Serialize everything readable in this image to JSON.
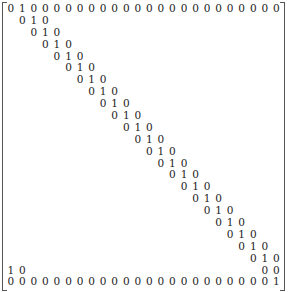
{
  "matrix": {
    "rows": 24,
    "cols": 24,
    "entries": [
      [
        "0",
        "1",
        "0",
        "0",
        "0",
        "0",
        "0",
        "0",
        "0",
        "0",
        "0",
        "0",
        "0",
        "0",
        "0",
        "0",
        "0",
        "0",
        "0",
        "0",
        "0",
        "0",
        "0",
        "0"
      ],
      [
        "",
        "0",
        "1",
        "0",
        "",
        "",
        "",
        "",
        "",
        "",
        "",
        "",
        "",
        "",
        "",
        "",
        "",
        "",
        "",
        "",
        "",
        "",
        "",
        ""
      ],
      [
        "",
        "",
        "0",
        "1",
        "0",
        "",
        "",
        "",
        "",
        "",
        "",
        "",
        "",
        "",
        "",
        "",
        "",
        "",
        "",
        "",
        "",
        "",
        "",
        ""
      ],
      [
        "",
        "",
        "",
        "0",
        "1",
        "0",
        "",
        "",
        "",
        "",
        "",
        "",
        "",
        "",
        "",
        "",
        "",
        "",
        "",
        "",
        "",
        "",
        "",
        ""
      ],
      [
        "",
        "",
        "",
        "",
        "0",
        "1",
        "0",
        "",
        "",
        "",
        "",
        "",
        "",
        "",
        "",
        "",
        "",
        "",
        "",
        "",
        "",
        "",
        "",
        ""
      ],
      [
        "",
        "",
        "",
        "",
        "",
        "0",
        "1",
        "0",
        "",
        "",
        "",
        "",
        "",
        "",
        "",
        "",
        "",
        "",
        "",
        "",
        "",
        "",
        "",
        ""
      ],
      [
        "",
        "",
        "",
        "",
        "",
        "",
        "0",
        "1",
        "0",
        "",
        "",
        "",
        "",
        "",
        "",
        "",
        "",
        "",
        "",
        "",
        "",
        "",
        "",
        ""
      ],
      [
        "",
        "",
        "",
        "",
        "",
        "",
        "",
        "0",
        "1",
        "0",
        "",
        "",
        "",
        "",
        "",
        "",
        "",
        "",
        "",
        "",
        "",
        "",
        "",
        ""
      ],
      [
        "",
        "",
        "",
        "",
        "",
        "",
        "",
        "",
        "0",
        "1",
        "0",
        "",
        "",
        "",
        "",
        "",
        "",
        "",
        "",
        "",
        "",
        "",
        "",
        ""
      ],
      [
        "",
        "",
        "",
        "",
        "",
        "",
        "",
        "",
        "",
        "0",
        "1",
        "0",
        "",
        "",
        "",
        "",
        "",
        "",
        "",
        "",
        "",
        "",
        "",
        ""
      ],
      [
        "",
        "",
        "",
        "",
        "",
        "",
        "",
        "",
        "",
        "",
        "0",
        "1",
        "0",
        "",
        "",
        "",
        "",
        "",
        "",
        "",
        "",
        "",
        "",
        ""
      ],
      [
        "",
        "",
        "",
        "",
        "",
        "",
        "",
        "",
        "",
        "",
        "",
        "0",
        "1",
        "0",
        "",
        "",
        "",
        "",
        "",
        "",
        "",
        "",
        "",
        ""
      ],
      [
        "",
        "",
        "",
        "",
        "",
        "",
        "",
        "",
        "",
        "",
        "",
        "",
        "0",
        "1",
        "0",
        "",
        "",
        "",
        "",
        "",
        "",
        "",
        "",
        ""
      ],
      [
        "",
        "",
        "",
        "",
        "",
        "",
        "",
        "",
        "",
        "",
        "",
        "",
        "",
        "0",
        "1",
        "0",
        "",
        "",
        "",
        "",
        "",
        "",
        "",
        ""
      ],
      [
        "",
        "",
        "",
        "",
        "",
        "",
        "",
        "",
        "",
        "",
        "",
        "",
        "",
        "",
        "0",
        "1",
        "0",
        "",
        "",
        "",
        "",
        "",
        "",
        ""
      ],
      [
        "",
        "",
        "",
        "",
        "",
        "",
        "",
        "",
        "",
        "",
        "",
        "",
        "",
        "",
        "",
        "0",
        "1",
        "0",
        "",
        "",
        "",
        "",
        "",
        ""
      ],
      [
        "",
        "",
        "",
        "",
        "",
        "",
        "",
        "",
        "",
        "",
        "",
        "",
        "",
        "",
        "",
        "",
        "0",
        "1",
        "0",
        "",
        "",
        "",
        "",
        ""
      ],
      [
        "",
        "",
        "",
        "",
        "",
        "",
        "",
        "",
        "",
        "",
        "",
        "",
        "",
        "",
        "",
        "",
        "",
        "0",
        "1",
        "0",
        "",
        "",
        "",
        ""
      ],
      [
        "",
        "",
        "",
        "",
        "",
        "",
        "",
        "",
        "",
        "",
        "",
        "",
        "",
        "",
        "",
        "",
        "",
        "",
        "0",
        "1",
        "0",
        "",
        "",
        ""
      ],
      [
        "",
        "",
        "",
        "",
        "",
        "",
        "",
        "",
        "",
        "",
        "",
        "",
        "",
        "",
        "",
        "",
        "",
        "",
        "",
        "0",
        "1",
        "0",
        "",
        ""
      ],
      [
        "",
        "",
        "",
        "",
        "",
        "",
        "",
        "",
        "",
        "",
        "",
        "",
        "",
        "",
        "",
        "",
        "",
        "",
        "",
        "",
        "0",
        "1",
        "0",
        ""
      ],
      [
        "",
        "",
        "",
        "",
        "",
        "",
        "",
        "",
        "",
        "",
        "",
        "",
        "",
        "",
        "",
        "",
        "",
        "",
        "",
        "",
        "",
        "0",
        "1",
        "0"
      ],
      [
        "1",
        "0",
        "",
        "",
        "",
        "",
        "",
        "",
        "",
        "",
        "",
        "",
        "",
        "",
        "",
        "",
        "",
        "",
        "",
        "",
        "",
        "",
        "0",
        "0"
      ],
      [
        "0",
        "0",
        "0",
        "0",
        "0",
        "0",
        "0",
        "0",
        "0",
        "0",
        "0",
        "0",
        "0",
        "0",
        "0",
        "0",
        "0",
        "0",
        "0",
        "0",
        "0",
        "0",
        "0",
        "1"
      ]
    ]
  }
}
